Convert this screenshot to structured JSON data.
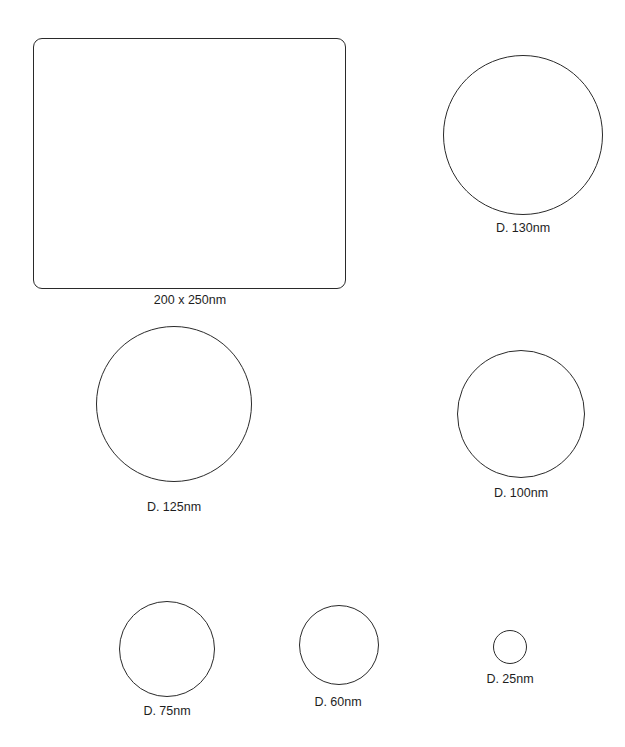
{
  "diagram": {
    "shapes": [
      {
        "id": "rect-200x250",
        "type": "rounded-rectangle",
        "label": "200 x 250nm",
        "x": 33,
        "y": 38,
        "w": 313,
        "h": 251,
        "label_x": 190,
        "label_y": 293
      },
      {
        "id": "circle-130",
        "type": "circle",
        "label": "D. 130nm",
        "cx": 523,
        "cy": 135,
        "r": 80,
        "label_x": 523,
        "label_y": 221
      },
      {
        "id": "circle-125",
        "type": "circle",
        "label": "D. 125nm",
        "cx": 174,
        "cy": 404,
        "r": 78,
        "label_x": 174,
        "label_y": 500
      },
      {
        "id": "circle-100",
        "type": "circle",
        "label": "D. 100nm",
        "cx": 521,
        "cy": 414,
        "r": 64,
        "label_x": 521,
        "label_y": 486
      },
      {
        "id": "circle-75",
        "type": "circle",
        "label": "D. 75nm",
        "cx": 167,
        "cy": 649,
        "r": 48,
        "label_x": 167,
        "label_y": 704
      },
      {
        "id": "circle-60",
        "type": "circle",
        "label": "D. 60nm",
        "cx": 339,
        "cy": 645,
        "r": 40,
        "label_x": 338,
        "label_y": 695
      },
      {
        "id": "circle-25",
        "type": "circle",
        "label": "D. 25nm",
        "cx": 510,
        "cy": 647,
        "r": 17,
        "label_x": 510,
        "label_y": 672
      }
    ],
    "stroke_color": "#2a2a2a",
    "background_color": "#ffffff"
  }
}
